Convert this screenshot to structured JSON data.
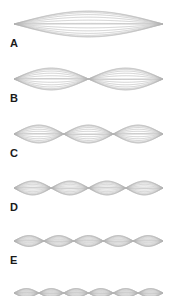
{
  "figure": {
    "type": "standing-wave-harmonics-diagram",
    "background_color": "#ffffff",
    "stroke_color": "#b4b4b4",
    "label_color": "#1a1a1a",
    "width": 175,
    "height": 296,
    "string_left_x": 14,
    "string_right_x": 163,
    "curves_per_lobe": 7
  },
  "rows": [
    {
      "label": "A",
      "harmonic": 1,
      "lobes": 1,
      "axis_y": 24,
      "amplitude": 13,
      "label_x": 10,
      "label_y": 38
    },
    {
      "label": "B",
      "harmonic": 2,
      "lobes": 2,
      "axis_y": 79,
      "amplitude": 11,
      "label_x": 10,
      "label_y": 93
    },
    {
      "label": "C",
      "harmonic": 3,
      "lobes": 3,
      "axis_y": 134,
      "amplitude": 9,
      "label_x": 10,
      "label_y": 148
    },
    {
      "label": "D",
      "harmonic": 4,
      "lobes": 4,
      "axis_y": 188,
      "amplitude": 7,
      "label_x": 10,
      "label_y": 202
    },
    {
      "label": "E",
      "harmonic": 5,
      "lobes": 5,
      "axis_y": 241,
      "amplitude": 5.5,
      "label_x": 10,
      "label_y": 255
    },
    {
      "label": "",
      "harmonic": 6,
      "lobes": 6,
      "axis_y": 293,
      "amplitude": 4.5,
      "label_x": 10,
      "label_y": 307
    }
  ]
}
